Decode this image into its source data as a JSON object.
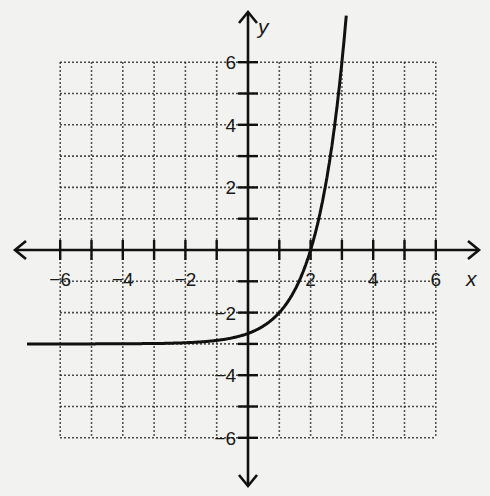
{
  "chart_data": {
    "type": "line",
    "title": "",
    "xlabel": "x",
    "ylabel": "y",
    "xlim": [
      -7,
      7
    ],
    "ylim": [
      -7,
      7
    ],
    "grid": true,
    "grid_range": {
      "x": [
        -6,
        6
      ],
      "y": [
        -6,
        6
      ]
    },
    "x_tick_labels": [
      "-6",
      "-4",
      "-2",
      "2",
      "4",
      "6"
    ],
    "y_tick_labels": [
      "6",
      "4",
      "2",
      "-2",
      "-4",
      "-6"
    ],
    "series": [
      {
        "name": "f(x) = 3^(x-1) - 3",
        "horizontal_asymptote": -3,
        "x": [
          -7,
          -6,
          -4,
          -2,
          0,
          1,
          2,
          2.5,
          3
        ],
        "y": [
          -3.0,
          -3.0,
          -2.99,
          -2.96,
          -2.67,
          -2,
          0,
          2.2,
          6
        ]
      }
    ]
  },
  "labels": {
    "x_axis": "x",
    "y_axis": "y",
    "xticks": [
      {
        "v": -6,
        "t": "−6"
      },
      {
        "v": -4,
        "t": "−4"
      },
      {
        "v": -2,
        "t": "−2"
      },
      {
        "v": 2,
        "t": "2"
      },
      {
        "v": 4,
        "t": "4"
      },
      {
        "v": 6,
        "t": "6"
      }
    ],
    "yticks": [
      {
        "v": 6,
        "t": "6"
      },
      {
        "v": 4,
        "t": "4"
      },
      {
        "v": 2,
        "t": "2"
      },
      {
        "v": -2,
        "t": "−2"
      },
      {
        "v": -4,
        "t": "−4"
      },
      {
        "v": -6,
        "t": "−6"
      }
    ]
  }
}
